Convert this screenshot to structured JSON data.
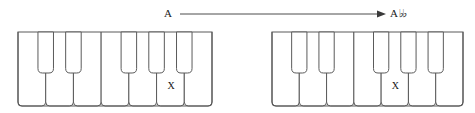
{
  "figure": {
    "type": "music-theory-keyboard-diagram",
    "background_color": "#ffffff",
    "stroke_color": "#5a5a5a",
    "text_color": "#1a1a1a"
  },
  "transposition": {
    "source_label": "A",
    "target_note": "A",
    "target_accidental": "♭♭",
    "target_label": "A♭♭",
    "arrow_icon": "right-arrow-icon",
    "arrow_start_x": 180,
    "arrow_end_x": 386,
    "arrow_y": 14
  },
  "keyboards": [
    {
      "id": "keyboard-left",
      "name": "source-keyboard",
      "x": 18,
      "y": 32,
      "width": 194,
      "height": 74,
      "white_key_count": 7,
      "black_key_count": 5,
      "black_key_groups": [
        2,
        3
      ],
      "black_key_height": 41,
      "marked_white_key_index": 6,
      "marker_symbol": "X"
    },
    {
      "id": "keyboard-right",
      "name": "target-keyboard",
      "x": 272,
      "y": 32,
      "width": 191,
      "height": 74,
      "white_key_count": 7,
      "black_key_count": 5,
      "black_key_groups": [
        2,
        3
      ],
      "black_key_height": 41,
      "marked_white_key_index": 5,
      "marker_symbol": "X"
    }
  ]
}
